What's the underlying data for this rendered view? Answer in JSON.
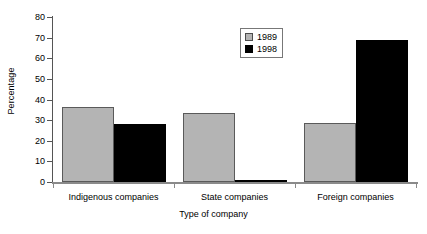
{
  "chart_data": {
    "type": "bar",
    "title": "",
    "xlabel": "Type of company",
    "ylabel": "Percentage",
    "categories": [
      "Indigenous companies",
      "State companies",
      "Foreign companies"
    ],
    "series": [
      {
        "name": "1989",
        "color": "#b4b4b4",
        "values": [
          36.5,
          33.5,
          28.5
        ]
      },
      {
        "name": "1998",
        "color": "#000000",
        "values": [
          28,
          1,
          69
        ]
      }
    ],
    "ylim": [
      0,
      80
    ],
    "ytick_labels": [
      "80",
      "70",
      "60",
      "50",
      "40",
      "30",
      "20",
      "10",
      "0"
    ],
    "ytick_values": [
      80,
      70,
      60,
      50,
      40,
      30,
      20,
      10,
      0
    ],
    "grid": false,
    "legend_position": "top-center"
  },
  "legend": {
    "entries": [
      {
        "label": "1989"
      },
      {
        "label": "1998"
      }
    ]
  }
}
